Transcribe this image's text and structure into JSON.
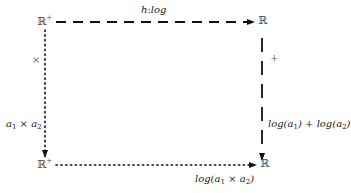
{
  "nodes": {
    "top_left": {
      "base": "ℝ",
      "sup": "+"
    },
    "top_right": {
      "base": "ℝ",
      "sup": ""
    },
    "bottom_left": {
      "base": "ℝ",
      "sup": "+"
    },
    "bottom_right": {
      "base": "ℝ",
      "sup": ""
    }
  },
  "arrows": {
    "top": {
      "label_parts": [
        "h",
        ":",
        "log"
      ],
      "style": "dashed"
    },
    "right": {
      "label": "+",
      "style": "dashed"
    },
    "left": {
      "label": "×",
      "style": "dotted"
    },
    "bottom": {
      "style": "dotted"
    }
  },
  "labels": {
    "left_expr": {
      "a": "a",
      "sub1": "1",
      "op": " × ",
      "b": "a",
      "sub2": "2"
    },
    "right_expr": {
      "f1": "log(",
      "a1": "a",
      "sub1": "1",
      "close1": ")",
      "op": " + ",
      "f2": "log(",
      "a2": "a",
      "sub2": "2",
      "close2": ")"
    },
    "bottom_expr": {
      "f": "log(",
      "a1": "a",
      "sub1": "1",
      "op": " × ",
      "a2": "a",
      "sub2": "2",
      "close": ")"
    }
  },
  "colors": {
    "stroke": "#111111",
    "node_text": "#555555"
  }
}
